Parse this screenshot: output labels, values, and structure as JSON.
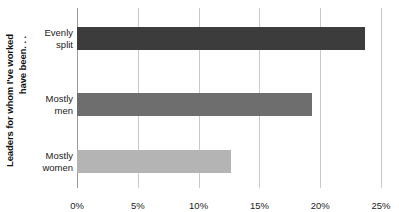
{
  "chart_data": {
    "type": "bar",
    "orientation": "horizontal",
    "title": "",
    "subtitle": "",
    "xlabel": "",
    "ylabel": "Leaders for whom I've worked have been. . .",
    "ylabel_line1": "Leaders for whom I've worked",
    "ylabel_line2": "have been. . .",
    "categories": [
      "Evenly split",
      "Mostly men",
      "Mostly women"
    ],
    "category_lines": [
      [
        "Evenly",
        "split"
      ],
      [
        "Mostly",
        "men"
      ],
      [
        "Mostly",
        "women"
      ]
    ],
    "values": [
      23.7,
      19.3,
      12.7
    ],
    "value_labels": [
      "23.7%",
      "19.3%",
      "12.7%"
    ],
    "bar_colors": [
      "#3c3c3c",
      "#6e6e6e",
      "#b4b4b4"
    ],
    "xlim": [
      0,
      25
    ],
    "xticks": [
      0,
      5,
      10,
      15,
      20,
      25
    ],
    "xtick_labels": [
      "0%",
      "5%",
      "10%",
      "15%",
      "20%",
      "25%"
    ],
    "grid": true,
    "grid_axis": "x",
    "grid_color": "#c9c9c9",
    "axis_color": "#9a9a9a",
    "legend": false,
    "background": "#ffffff",
    "data_labels_shown": false
  }
}
